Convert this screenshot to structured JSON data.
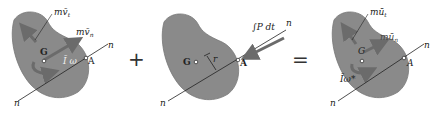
{
  "figure": {
    "colors": {
      "body_fill": "#8a8a8a",
      "body_stroke": "#6f6f6f",
      "arrow": "#6b6b6b",
      "line": "#222222"
    },
    "operators": {
      "plus": "+",
      "equals": "="
    },
    "panel1": {
      "labels": {
        "mv_t": "mv̄",
        "mv_t_sub": "t",
        "mv_n": "mv̄",
        "mv_n_sub": "n",
        "G": "G",
        "A": "A",
        "Iw": "Ī ω",
        "n_top": "n",
        "n_bottom": "n"
      }
    },
    "panel2": {
      "labels": {
        "impulse": "∫P dt",
        "G": "G",
        "r": "r",
        "A": "A",
        "n_top": "n",
        "n_bottom": "n"
      }
    },
    "panel3": {
      "labels": {
        "mu_t": "mū",
        "mu_t_sub": "t",
        "mu_n": "mū",
        "mu_n_sub": "n",
        "G": "G",
        "A": "A",
        "Iw": "Īω*",
        "n_top": "n",
        "n_bottom": "n"
      }
    }
  }
}
